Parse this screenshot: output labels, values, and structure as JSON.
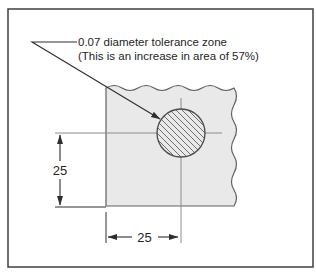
{
  "diagram": {
    "caption": {
      "line1": "0.07 diameter tolerance zone",
      "line2": "(This is an increase in area of 57%)"
    },
    "dimensions": {
      "vertical_label": "25",
      "horizontal_label": "25"
    },
    "colors": {
      "background": "#ffffff",
      "frame_border": "#3f3f3f",
      "part_fill": "#e9e9e9",
      "part_outline": "#606060",
      "dimension_line": "#2e2e2e",
      "centerline": "#8c8c8c",
      "hatch_line": "#6f6f6f",
      "circle_outline": "#4a4a4a"
    }
  }
}
